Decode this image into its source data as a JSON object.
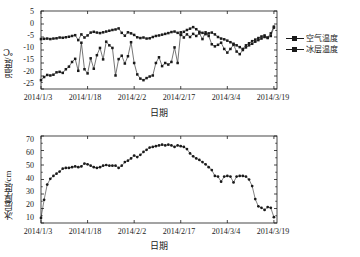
{
  "figure": {
    "background": "#ffffff",
    "ink_color": "#1a1a1a"
  },
  "top_chart": {
    "ylabel": "温度/℃",
    "xlabel": "日期",
    "yticks": [
      "5",
      "0",
      "-5",
      "-10",
      "-15",
      "-20",
      "-25"
    ],
    "xticks": [
      "2014/1/3",
      "2014/1/18",
      "2014/2/2",
      "2014/2/17",
      "2014/3/4",
      "2014/3/19"
    ],
    "legend": [
      {
        "label": "空气温度",
        "marker": "square-line"
      },
      {
        "label": "冰层温度",
        "marker": "square-line"
      }
    ]
  },
  "bottom_chart": {
    "ylabel": "冰层厚度/cm",
    "xlabel": "日期",
    "yticks": [
      "70",
      "60",
      "50",
      "40",
      "30",
      "20",
      "10"
    ],
    "xticks": [
      "2014/1/3",
      "2014/1/18",
      "2014/2/2",
      "2014/2/17",
      "2014/3/4",
      "2014/3/19"
    ]
  },
  "chart_data": [
    {
      "type": "line",
      "id": "temperature-timeseries",
      "title": "",
      "xlabel": "日期",
      "ylabel": "温度/℃",
      "xlim": [
        0,
        76
      ],
      "ylim": [
        -25,
        5
      ],
      "ytick_values": [
        5,
        0,
        -5,
        -10,
        -15,
        -20,
        -25
      ],
      "xtick_values": [
        0,
        15,
        30,
        45,
        60,
        75
      ],
      "xtick_labels": [
        "2014/1/3",
        "2014/1/18",
        "2014/2/2",
        "2014/2/17",
        "2014/3/4",
        "2014/3/19"
      ],
      "grid": false,
      "legend_position": "right-outside",
      "x": [
        0,
        1,
        2,
        3,
        4,
        5,
        6,
        7,
        8,
        9,
        10,
        11,
        12,
        13,
        14,
        15,
        16,
        17,
        18,
        19,
        20,
        21,
        22,
        23,
        24,
        25,
        26,
        27,
        28,
        29,
        30,
        31,
        32,
        33,
        34,
        35,
        36,
        37,
        38,
        39,
        40,
        41,
        42,
        43,
        44,
        45,
        46,
        47,
        48,
        49,
        50,
        51,
        52,
        53,
        54,
        55,
        56,
        57,
        58,
        59,
        60,
        61,
        62,
        63,
        64,
        65,
        66,
        67,
        68,
        69,
        70,
        71,
        72,
        73,
        74,
        75
      ],
      "series": [
        {
          "name": "空气温度",
          "marker": "square",
          "values": [
            -5.8,
            -5.7,
            -5.6,
            -5.8,
            -5.6,
            -5.5,
            -5.2,
            -5.3,
            -5.1,
            -4.9,
            -4.6,
            -4.3,
            -6.2,
            -4.0,
            -5.2,
            -4.4,
            -3.3,
            -3.0,
            -3.3,
            -3.5,
            -3.2,
            -2.9,
            -2.6,
            -2.3,
            -2.1,
            -1.7,
            -3.4,
            -4.5,
            -3.2,
            -3.6,
            -4.2,
            -5.1,
            -5.4,
            -5.2,
            -5.6,
            -5.5,
            -5.0,
            -4.6,
            -4.4,
            -4.1,
            -3.8,
            -3.5,
            -3.1,
            -2.9,
            -3.4,
            -4.2,
            -3.0,
            -2.3,
            -1.8,
            -1.2,
            -2.0,
            -3.0,
            -3.4,
            -3.9,
            -3.6,
            -3.3,
            -4.0,
            -5.0,
            -5.6,
            -5.9,
            -6.4,
            -7.0,
            -7.6,
            -8.2,
            -8.9,
            -9.6,
            -8.2,
            -7.4,
            -6.6,
            -6.0,
            -5.4,
            -4.8,
            -4.4,
            -5.2,
            -3.6,
            -1.0
          ]
        },
        {
          "name": "冰层温度",
          "marker": "square",
          "values": [
            -21.6,
            -20.4,
            -19.6,
            -19.8,
            -19.5,
            -18.6,
            -18.4,
            -18.8,
            -17.4,
            -16.4,
            -14.6,
            -13.4,
            -18.0,
            -7.2,
            -17.4,
            -19.0,
            -13.2,
            -17.2,
            -12.0,
            -9.2,
            -13.6,
            -6.8,
            -8.2,
            -9.2,
            -19.8,
            -13.5,
            -12.2,
            -15.2,
            -12.4,
            -7.0,
            -15.0,
            -19.4,
            -21.0,
            -21.6,
            -20.8,
            -20.2,
            -19.8,
            -15.0,
            -12.8,
            -16.2,
            -15.0,
            -15.6,
            -14.6,
            -9.0,
            -15.0,
            -3.2,
            -5.2,
            -4.0,
            -5.0,
            -3.8,
            -4.6,
            -3.6,
            -5.8,
            -3.2,
            -4.6,
            -7.8,
            -8.6,
            -8.0,
            -7.2,
            -9.6,
            -11.0,
            -9.6,
            -8.0,
            -10.6,
            -11.6,
            -10.0,
            -9.0,
            -8.2,
            -7.6,
            -6.8,
            -6.2,
            -5.6,
            -5.0,
            -5.4,
            -4.6,
            -1.4
          ]
        }
      ]
    },
    {
      "type": "line",
      "id": "ice-thickness-timeseries",
      "title": "",
      "xlabel": "日期",
      "ylabel": "冰层厚度/cm",
      "xlim": [
        0,
        76
      ],
      "ylim": [
        10,
        70
      ],
      "ytick_values": [
        70,
        60,
        50,
        40,
        30,
        20,
        10
      ],
      "xtick_values": [
        0,
        15,
        30,
        45,
        60,
        75
      ],
      "xtick_labels": [
        "2014/1/3",
        "2014/1/18",
        "2014/2/2",
        "2014/2/17",
        "2014/3/4",
        "2014/3/19"
      ],
      "grid": false,
      "legend_position": "none",
      "x": [
        0,
        1,
        2,
        3,
        4,
        5,
        6,
        7,
        8,
        9,
        10,
        11,
        12,
        13,
        14,
        15,
        16,
        17,
        18,
        19,
        20,
        21,
        22,
        23,
        24,
        25,
        26,
        27,
        28,
        29,
        30,
        31,
        32,
        33,
        34,
        35,
        36,
        37,
        38,
        39,
        40,
        41,
        42,
        43,
        44,
        45,
        46,
        47,
        48,
        49,
        50,
        51,
        52,
        53,
        54,
        55,
        56,
        57,
        58,
        59,
        60,
        61,
        62,
        63,
        64,
        65,
        66,
        67,
        68,
        69,
        70,
        71,
        72,
        73,
        74,
        75
      ],
      "series": [
        {
          "name": "冰层厚度",
          "marker": "circle",
          "values": [
            13.5,
            26.0,
            36.5,
            40.5,
            42.5,
            44.0,
            45.5,
            47.5,
            48.0,
            48.0,
            48.5,
            49.0,
            48.5,
            49.0,
            51.0,
            50.5,
            49.5,
            48.5,
            48.0,
            48.5,
            49.5,
            50.0,
            49.5,
            49.5,
            49.5,
            48.0,
            49.5,
            52.0,
            53.0,
            54.5,
            56.5,
            55.5,
            57.0,
            59.0,
            60.5,
            62.0,
            62.5,
            63.0,
            63.5,
            64.0,
            63.5,
            64.0,
            63.5,
            62.5,
            63.5,
            63.0,
            62.5,
            61.0,
            58.0,
            56.0,
            54.5,
            53.5,
            52.0,
            50.5,
            48.5,
            46.5,
            42.5,
            42.0,
            38.5,
            42.0,
            42.5,
            42.0,
            38.0,
            42.0,
            42.5,
            42.5,
            42.0,
            40.0,
            35.5,
            26.5,
            21.5,
            20.5,
            19.0,
            21.0,
            20.5,
            14.0
          ]
        }
      ]
    }
  ]
}
